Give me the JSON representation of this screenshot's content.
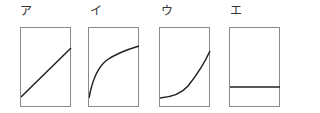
{
  "panels": [
    {
      "label": "ア",
      "curve": "linear-increasing"
    },
    {
      "label": "イ",
      "curve": "concave-increasing"
    },
    {
      "label": "ウ",
      "curve": "convex-increasing"
    },
    {
      "label": "エ",
      "curve": "constant"
    }
  ],
  "colors": {
    "line": "#222222",
    "border": "#8a8a8a",
    "text": "#333333"
  }
}
